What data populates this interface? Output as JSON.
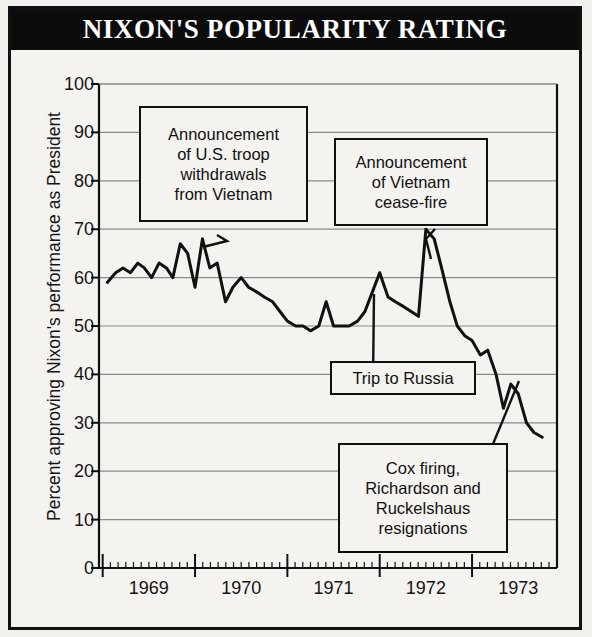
{
  "title": "NIXON'S POPULARITY RATING",
  "axes": {
    "ylabel": "Percent approving Nixon's performance as President",
    "y_ticks": [
      "0",
      "10",
      "20",
      "30",
      "40",
      "50",
      "60",
      "70",
      "80",
      "90",
      "100"
    ],
    "x_ticks": [
      "1969",
      "1970",
      "1971",
      "1972",
      "1973"
    ]
  },
  "annotations": [
    {
      "id": "troop-withdrawals",
      "lines": [
        "Announcement",
        "of U.S. troop",
        "withdrawals",
        "from Vietnam"
      ]
    },
    {
      "id": "cease-fire",
      "lines": [
        "Announcement",
        "of Vietnam",
        "cease-fire"
      ]
    },
    {
      "id": "trip-to-russia",
      "lines": [
        "Trip to Russia"
      ]
    },
    {
      "id": "cox-firing",
      "lines": [
        "Cox firing,",
        "Richardson and",
        "Ruckelshaus",
        "resignations"
      ]
    }
  ],
  "colors": {
    "banner": "#0c0c0c",
    "banner_text": "#ffffff",
    "paper": "#f4f3f0",
    "ink": "#111111",
    "grid": "#8a8a8a",
    "line": "#111111"
  },
  "chart_data": {
    "type": "line",
    "title": "NIXON'S POPULARITY RATING",
    "xlabel": "",
    "ylabel": "Percent approving Nixon's performance as President",
    "xlim": [
      1968.96,
      1973.92
    ],
    "ylim": [
      0,
      100
    ],
    "grid": true,
    "legend": null,
    "x_tick_values": [
      1969.0,
      1970.0,
      1971.0,
      1972.0,
      1973.0
    ],
    "x_tick_labels": [
      "1969",
      "1970",
      "1971",
      "1972",
      "1973"
    ],
    "y_tick_values": [
      0,
      10,
      20,
      30,
      40,
      50,
      60,
      70,
      80,
      90,
      100
    ],
    "series": [
      {
        "name": "Percent approving Nixon's performance as President",
        "x": [
          1969.05,
          1969.14,
          1969.22,
          1969.3,
          1969.38,
          1969.45,
          1969.53,
          1969.61,
          1969.69,
          1969.76,
          1969.84,
          1969.92,
          1970.0,
          1970.08,
          1970.16,
          1970.24,
          1970.33,
          1970.41,
          1970.5,
          1970.58,
          1970.67,
          1970.75,
          1970.84,
          1970.92,
          1971.0,
          1971.09,
          1971.17,
          1971.25,
          1971.34,
          1971.42,
          1971.5,
          1971.59,
          1971.67,
          1971.76,
          1971.84,
          1971.92,
          1972.0,
          1972.09,
          1972.17,
          1972.26,
          1972.34,
          1972.42,
          1972.5,
          1972.59,
          1972.67,
          1972.76,
          1972.84,
          1972.92,
          1973.0,
          1973.09,
          1973.17,
          1973.26,
          1973.34,
          1973.42,
          1973.5,
          1973.59,
          1973.67,
          1973.76
        ],
        "y": [
          59,
          61,
          62,
          61,
          63,
          62,
          60,
          63,
          62,
          60,
          67,
          65,
          58,
          68,
          62,
          63,
          55,
          58,
          60,
          58,
          57,
          56,
          55,
          53,
          51,
          50,
          50,
          49,
          50,
          55,
          50,
          50,
          50,
          51,
          53,
          57,
          61,
          56,
          55,
          54,
          53,
          52,
          70,
          68,
          62,
          55,
          50,
          48,
          47,
          44,
          45,
          40,
          33,
          38,
          36,
          30,
          28,
          27
        ]
      }
    ],
    "annotations": [
      {
        "text": "Announcement of U.S. troop withdrawals from Vietnam",
        "points_to_x": 1969.84,
        "points_to_y": 67
      },
      {
        "text": "Announcement of Vietnam cease-fire",
        "points_to_x": 1972.5,
        "points_to_y": 70
      },
      {
        "text": "Trip to Russia",
        "points_to_x": 1972.0,
        "points_to_y": 61
      },
      {
        "text": "Cox firing, Richardson and Ruckelshaus resignations",
        "points_to_x": 1973.42,
        "points_to_y": 38
      }
    ]
  }
}
